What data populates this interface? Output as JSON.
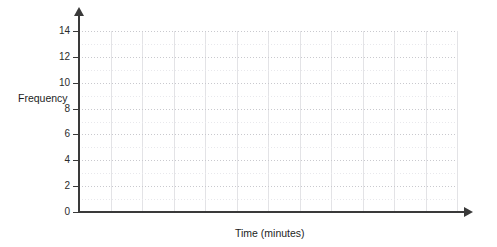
{
  "chart_data": {
    "type": "bar",
    "title": "",
    "subtitle": "",
    "xlabel": "Time (minutes)",
    "ylabel": "Frequency",
    "categories": [],
    "values": [],
    "series": [],
    "annotations": [],
    "legend": [],
    "legend_position": "none",
    "grid": true,
    "grid_style": "dotted-horizontal-solid-vertical",
    "empty_plot": true,
    "xlim": [
      0,
      12
    ],
    "ylim": [
      0,
      15
    ],
    "y_ticks": [
      0,
      2,
      4,
      6,
      8,
      10,
      12,
      14
    ],
    "y_tick_labels": [
      "0",
      "2",
      "4",
      "6",
      "8",
      "10",
      "12",
      "14"
    ],
    "y_minor_tick_step": 1,
    "x_ticks": [
      0,
      1,
      2,
      3,
      4,
      5,
      6,
      7,
      8,
      9,
      10,
      11,
      12
    ],
    "x_tick_labels": [],
    "axis_arrows": {
      "x": "right-arrow-icon",
      "y": "up-arrow-icon"
    },
    "colors": {
      "axis": "#3a3a3a",
      "grid_major": "#c9c9ce",
      "grid_minor": "#e8e8ec",
      "grid_vertical": "#e3e3e6",
      "text": "#1d1d1d",
      "background": "#ffffff"
    }
  },
  "axes": {
    "y_title": "Frequency",
    "x_title": "Time (minutes)"
  }
}
